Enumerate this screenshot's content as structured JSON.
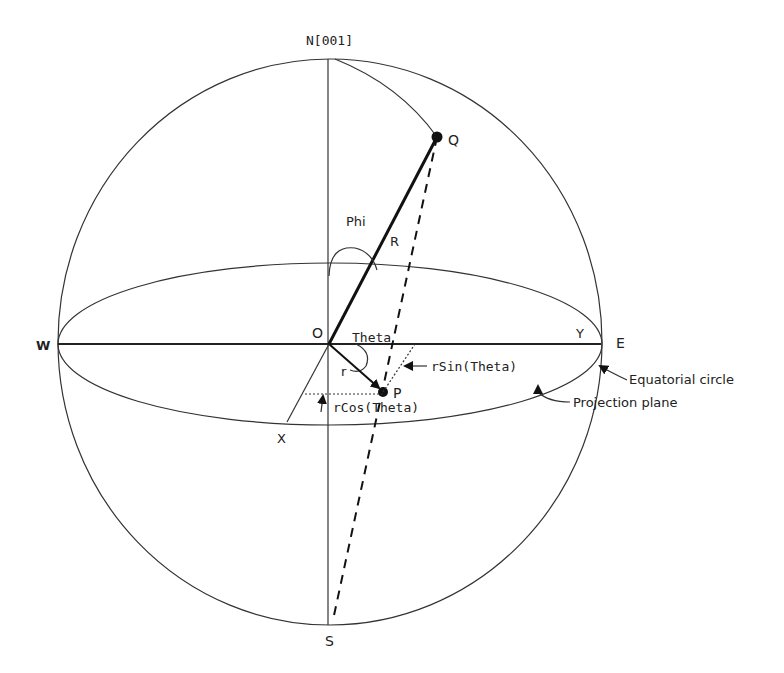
{
  "diagram": {
    "labels": {
      "north": "N[001]",
      "south": "S",
      "west": "W",
      "east": "E",
      "origin": "O",
      "point_q": "Q",
      "point_p": "P",
      "phi": "Phi",
      "big_r": "R",
      "theta": "Theta",
      "small_r": "r",
      "x_axis": "X",
      "y_axis": "Y",
      "r_sin_theta": "rSin(Theta)",
      "r_cos_theta": "rCos(Theta)",
      "equatorial_circle": "Equatorial circle",
      "projection_plane": "Projection plane"
    },
    "colors": {
      "line": "#111111",
      "background": "#ffffff"
    }
  }
}
